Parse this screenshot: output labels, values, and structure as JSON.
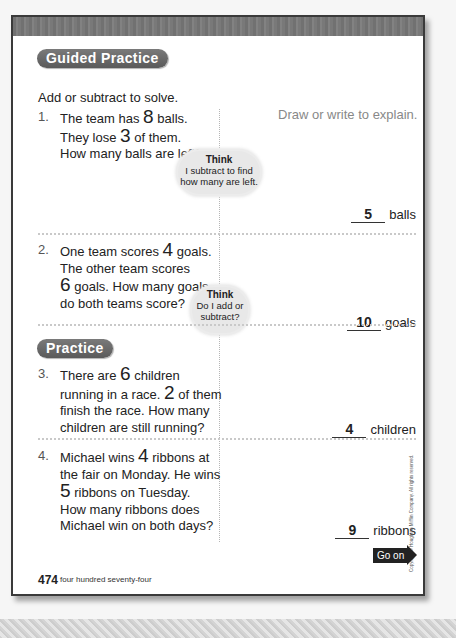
{
  "sections": {
    "guided_label": "Guided Practice",
    "practice_label": "Practice"
  },
  "instructions": "Add or subtract to solve.",
  "explain_label": "Draw or write to explain.",
  "problems": [
    {
      "number": "1.",
      "lines": [
        {
          "pre": "The team has ",
          "num": "8",
          "post": " balls."
        },
        {
          "pre": "They lose ",
          "num": "3",
          "post": " of them."
        },
        {
          "pre": "How many balls are left?",
          "num": "",
          "post": ""
        }
      ],
      "answer": "5",
      "unit": "balls",
      "think": {
        "title": "Think",
        "text1": "I subtract to find",
        "text2": "how many are left."
      }
    },
    {
      "number": "2.",
      "lines": [
        {
          "pre": "One team scores ",
          "num": "4",
          "post": " goals."
        },
        {
          "pre": "The other team scores",
          "num": "",
          "post": ""
        },
        {
          "pre": "",
          "num": "6",
          "post": " goals. How many goals"
        },
        {
          "pre": "do both teams score?",
          "num": "",
          "post": ""
        }
      ],
      "answer": "10",
      "unit": "goals",
      "think": {
        "title": "Think",
        "text1": "Do I add or",
        "text2": "subtract?"
      }
    },
    {
      "number": "3.",
      "lines": [
        {
          "pre": "There are ",
          "num": "6",
          "post": " children"
        },
        {
          "pre": "running in a race. ",
          "num": "2",
          "post": " of them"
        },
        {
          "pre": "finish the race. How many",
          "num": "",
          "post": ""
        },
        {
          "pre": "children are still running?",
          "num": "",
          "post": ""
        }
      ],
      "answer": "4",
      "unit": "children"
    },
    {
      "number": "4.",
      "lines": [
        {
          "pre": "Michael wins ",
          "num": "4",
          "post": " ribbons at"
        },
        {
          "pre": "the fair on Monday. He wins",
          "num": "",
          "post": ""
        },
        {
          "pre": "",
          "num": "5",
          "post": " ribbons on Tuesday."
        },
        {
          "pre": "How many ribbons does",
          "num": "",
          "post": ""
        },
        {
          "pre": "Michael win on both days?",
          "num": "",
          "post": ""
        }
      ],
      "answer": "9",
      "unit": "ribbons"
    }
  ],
  "footer": {
    "page_number": "474",
    "page_words": "four hundred seventy-four",
    "go_on": "Go on"
  },
  "copyright": "Copyright © Houghton Mifflin Company. All rights reserved.",
  "colors": {
    "pill": "#666666",
    "cloud": "#e8e8e8",
    "border": "#3a3a3a"
  }
}
